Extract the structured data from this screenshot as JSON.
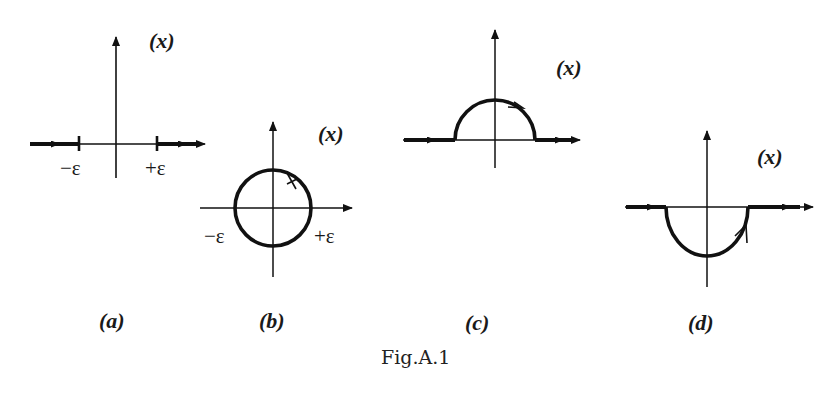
{
  "figure": {
    "caption": "Fig.A.1",
    "panels": [
      {
        "id": "a",
        "label": "(a)",
        "plane_label": "(x)",
        "left_tick": "−ε",
        "right_tick": "+ε",
        "contour": "real axis with thick segments outside [−ε,+ε], thin gap across origin"
      },
      {
        "id": "b",
        "label": "(b)",
        "plane_label": "(x)",
        "left_tick": "−ε",
        "right_tick": "+ε",
        "contour": "full circle of radius ε around origin, clockwise arrow at top"
      },
      {
        "id": "c",
        "label": "(c)",
        "plane_label": "(x)",
        "contour": "real axis detouring above origin along upper semicircle"
      },
      {
        "id": "d",
        "label": "(d)",
        "plane_label": "(x)",
        "contour": "real axis detouring below origin along lower semicircle"
      }
    ]
  }
}
